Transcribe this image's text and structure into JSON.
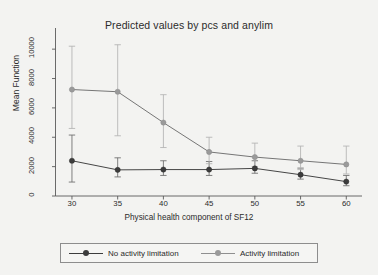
{
  "chart_data": {
    "type": "line",
    "title": "Predicted values by pcs and anylim",
    "xlabel": "Physical health component of SF12",
    "ylabel": "Mean Function",
    "x": [
      30,
      35,
      40,
      45,
      50,
      55,
      60
    ],
    "xticks": [
      "30",
      "35",
      "40",
      "45",
      "50",
      "55",
      "60"
    ],
    "yticks": [
      "0",
      "2000",
      "4000",
      "6000",
      "8000",
      "10000"
    ],
    "ytick_values": [
      0,
      2000,
      4000,
      6000,
      8000,
      10000
    ],
    "xlim": [
      28.2,
      61.5
    ],
    "ylim": [
      0,
      11100
    ],
    "grid": false,
    "legend_position": "below-plot",
    "error_bars": "capped-whiskers",
    "series": [
      {
        "name": "No activity limitation",
        "color": "#3c3c3c",
        "marker": "circle",
        "values": [
          2400,
          1780,
          1800,
          1800,
          1880,
          1450,
          980
        ],
        "lower": [
          950,
          1300,
          1400,
          1400,
          1550,
          1150,
          700
        ],
        "upper": [
          4150,
          2600,
          2400,
          2350,
          2400,
          1900,
          1400
        ]
      },
      {
        "name": "Activity limitation",
        "color": "#9a9a9a",
        "marker": "circle",
        "values": [
          7250,
          7100,
          5000,
          3000,
          2650,
          2400,
          2150
        ],
        "lower": [
          4600,
          4100,
          3300,
          2200,
          2000,
          1800,
          1500
        ],
        "upper": [
          10200,
          10300,
          6900,
          4000,
          3600,
          3400,
          3400
        ]
      }
    ]
  },
  "legend": {
    "entries": [
      {
        "label": "No activity limitation"
      },
      {
        "label": "Activity limitation"
      }
    ]
  }
}
